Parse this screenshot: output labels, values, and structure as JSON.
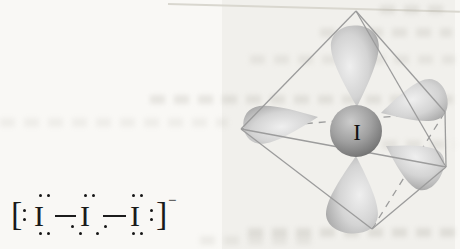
{
  "lewis_structure": {
    "open_bracket": "[",
    "close_bracket": "]",
    "charge_superscript": "−",
    "atoms": [
      "I",
      "I",
      "I"
    ]
  },
  "model": {
    "central_atom_label": "I"
  },
  "colors": {
    "background": "#f9f8f5",
    "ink": "#1a1a1a",
    "wireframe": "#9c9c9c",
    "lobe_highlight": "#efefef",
    "lobe_edge": "#969696",
    "sphere_light": "#cccccc",
    "sphere_dark": "#636363"
  }
}
